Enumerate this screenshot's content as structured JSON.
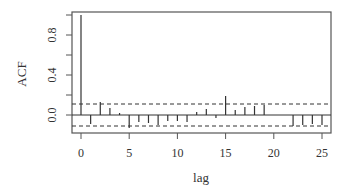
{
  "chart_data": {
    "type": "bar",
    "title": "",
    "xlabel": "lag",
    "ylabel": "ACF",
    "x": [
      0,
      1,
      2,
      3,
      4,
      5,
      6,
      7,
      8,
      9,
      10,
      11,
      12,
      13,
      14,
      15,
      16,
      17,
      18,
      19,
      20,
      21,
      22,
      23,
      24,
      25
    ],
    "values": [
      1.0,
      -0.09,
      0.13,
      0.07,
      0.02,
      -0.13,
      -0.07,
      -0.08,
      -0.1,
      -0.06,
      -0.06,
      -0.07,
      0.03,
      0.06,
      -0.03,
      0.19,
      0.05,
      0.08,
      0.09,
      0.1,
      0.0,
      0.0,
      -0.11,
      -0.1,
      -0.09,
      -0.1
    ],
    "confidence_band": [
      -0.11,
      0.11
    ],
    "xlim": [
      -1,
      26
    ],
    "ylim": [
      -0.18,
      1.03
    ],
    "xticks": [
      0,
      5,
      10,
      15,
      20,
      25
    ],
    "yticks": [
      0.0,
      0.2,
      0.4,
      0.6,
      0.8,
      1.0
    ],
    "ytick_labels_shown": [
      "0.0",
      "0.4",
      "0.8"
    ],
    "grid": false,
    "legend": null
  }
}
